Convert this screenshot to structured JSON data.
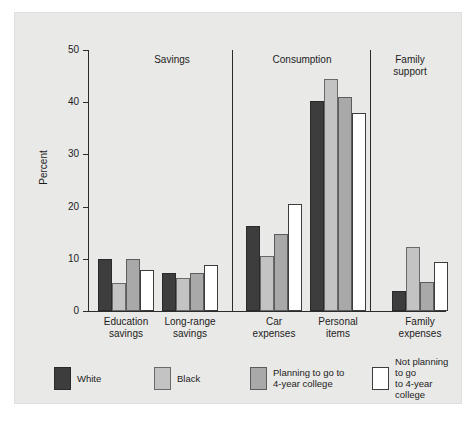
{
  "chart_data": {
    "type": "bar",
    "title": "",
    "xlabel": "",
    "ylabel": "Percent",
    "ylim": [
      0,
      50
    ],
    "yticks": [
      0,
      10,
      20,
      30,
      40,
      50
    ],
    "grid": false,
    "legend_position": "bottom",
    "categories": [
      "Education savings",
      "Long-range savings",
      "Car expenses",
      "Personal items",
      "Family expenses"
    ],
    "category_lines": [
      [
        "Education",
        "savings"
      ],
      [
        "Long-range",
        "savings"
      ],
      [
        "Car",
        "expenses"
      ],
      [
        "Personal",
        "items"
      ],
      [
        "Family",
        "expenses"
      ]
    ],
    "series": [
      {
        "name": "White",
        "key": "white",
        "color": "#3d3d3d",
        "values": [
          10.0,
          7.2,
          16.3,
          40.3,
          3.9
        ]
      },
      {
        "name": "Black",
        "key": "black",
        "color": "#c3c3c3",
        "values": [
          5.3,
          6.4,
          10.5,
          44.4,
          12.2
        ]
      },
      {
        "name": "Planning to go to 4-year college",
        "key": "planning",
        "color": "#a9a9a9",
        "values": [
          9.9,
          7.2,
          14.7,
          41.0,
          5.5
        ]
      },
      {
        "name": "Not planning to go to 4-year college",
        "key": "notplanning",
        "color": "#ffffff",
        "values": [
          7.8,
          8.8,
          20.5,
          37.9,
          9.3
        ]
      }
    ],
    "sections": [
      {
        "label": "Savings",
        "lines": [
          "Savings"
        ],
        "categories": [
          "Education savings",
          "Long-range savings"
        ]
      },
      {
        "label": "Consumption",
        "lines": [
          "Consumption"
        ],
        "categories": [
          "Car expenses",
          "Personal items"
        ]
      },
      {
        "label": "Family support",
        "lines": [
          "Family",
          "support"
        ],
        "categories": [
          "Family expenses"
        ]
      }
    ],
    "legend": [
      {
        "name": "White",
        "lines": [
          "White"
        ],
        "swatch": "white"
      },
      {
        "name": "Black",
        "lines": [
          "Black"
        ],
        "swatch": "black"
      },
      {
        "name": "Planning to go to 4-year college",
        "lines": [
          "Planning to go to",
          "4-year college"
        ],
        "swatch": "planning"
      },
      {
        "name": "Not planning to go to 4-year college",
        "lines": [
          "Not planning to go",
          "to 4-year college"
        ],
        "swatch": "notplanning"
      }
    ]
  },
  "axis": {
    "y_title": "Percent",
    "tick_labels": [
      "50",
      "40",
      "30",
      "20",
      "10",
      "0"
    ]
  },
  "sections": {
    "savings": "Savings",
    "consumption": "Consumption",
    "family_support_line1": "Family",
    "family_support_line2": "support"
  },
  "categories": {
    "c0_l1": "Education",
    "c0_l2": "savings",
    "c1_l1": "Long-range",
    "c1_l2": "savings",
    "c2_l1": "Car",
    "c2_l2": "expenses",
    "c3_l1": "Personal",
    "c3_l2": "items",
    "c4_l1": "Family",
    "c4_l2": "expenses"
  },
  "legend": {
    "white": "White",
    "black": "Black",
    "planning_l1": "Planning to go to",
    "planning_l2": "4-year college",
    "notplanning_l1": "Not planning to go",
    "notplanning_l2": "to 4-year college"
  }
}
